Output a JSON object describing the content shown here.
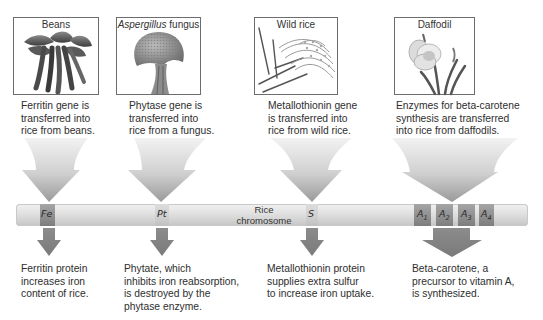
{
  "sources": [
    {
      "name": "beans",
      "image_label": "Beans",
      "label_italic": "",
      "label_rest": "Beans",
      "caption": [
        "Ferritin gene is",
        "transferred into",
        "rice from beans."
      ]
    },
    {
      "name": "aspergillus",
      "image_label": "Aspergillus fungus",
      "label_italic": "Aspergillus",
      "label_rest": " fungus",
      "caption": [
        "Phytase gene is",
        "transferred into",
        "rice from a fungus."
      ]
    },
    {
      "name": "wild-rice",
      "image_label": "Wild rice",
      "label_italic": "",
      "label_rest": "Wild rice",
      "caption": [
        "Metallothionin gene",
        "is transferred into",
        "rice from wild rice."
      ]
    },
    {
      "name": "daffodil",
      "image_label": "Daffodil",
      "label_italic": "",
      "label_rest": "Daffodil",
      "caption": [
        "Enzymes for beta-carotene",
        "synthesis are transferred",
        "into rice from daffodils."
      ]
    }
  ],
  "chromosome": {
    "label": [
      "Rice",
      "chromosome"
    ],
    "genes": [
      {
        "id": "Fe",
        "text": "Fe",
        "sub": ""
      },
      {
        "id": "Pt",
        "text": "Pt",
        "sub": ""
      },
      {
        "id": "S",
        "text": "S",
        "sub": ""
      },
      {
        "id": "A1",
        "text": "A",
        "sub": "1"
      },
      {
        "id": "A2",
        "text": "A",
        "sub": "2"
      },
      {
        "id": "A3",
        "text": "A",
        "sub": "3"
      },
      {
        "id": "A4",
        "text": "A",
        "sub": "4"
      }
    ]
  },
  "outcomes": [
    {
      "name": "ferritin",
      "caption": [
        "Ferritin protein",
        "increases iron",
        "content of rice."
      ]
    },
    {
      "name": "phytate",
      "caption": [
        "Phytate, which",
        "inhibits iron reabsorption,",
        "is destroyed by the",
        "phytase enzyme."
      ]
    },
    {
      "name": "metallothionin",
      "caption": [
        "Metallothionin protein",
        "supplies extra sulfur",
        "to increase iron uptake."
      ]
    },
    {
      "name": "beta-carotene",
      "caption": [
        "Beta-carotene, a",
        "precursor to vitamin A,",
        "is synthesized."
      ]
    }
  ],
  "colors": {
    "arrow_light": "#e6e6e6",
    "arrow_dark": "#8a8a8a",
    "band_dark": "#8e8e8e",
    "chromosome": "#dadada",
    "text": "#2e2e2e"
  }
}
